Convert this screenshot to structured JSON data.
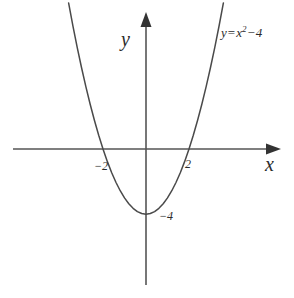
{
  "chart_data": {
    "type": "line",
    "title": "",
    "subtitle": "",
    "xlabel": "x",
    "ylabel": "y",
    "equation_label": "y = x² − 4",
    "equation_parts": {
      "lhs": "y",
      "equals": "=",
      "base": "x",
      "exponent": "2",
      "minus": "−",
      "constant": "4"
    },
    "function": "y = x^2 - 4",
    "grid": false,
    "legend": "none",
    "xlim": [
      -6.2,
      6.3
    ],
    "ylim": [
      -8.4,
      8.4
    ],
    "axis_arrows": [
      "x-positive",
      "y-positive"
    ],
    "x_tick_labels": [
      "−2",
      "2"
    ],
    "x_tick_values": [
      -2,
      2
    ],
    "y_tick_labels": [
      "−4"
    ],
    "y_tick_values": [
      -4
    ],
    "roots": [
      -2,
      2
    ],
    "vertex": [
      0,
      -4
    ],
    "y_intercept": -4,
    "x": [
      -3.6,
      -3.4,
      -3.2,
      -3.0,
      -2.8,
      -2.6,
      -2.4,
      -2.2,
      -2.0,
      -1.8,
      -1.6,
      -1.4,
      -1.2,
      -1.0,
      -0.8,
      -0.6,
      -0.4,
      -0.2,
      0.0,
      0.2,
      0.4,
      0.6,
      0.8,
      1.0,
      1.2,
      1.4,
      1.6,
      1.8,
      2.0,
      2.2,
      2.4,
      2.6,
      2.8,
      3.0,
      3.2,
      3.4,
      3.6
    ],
    "y": [
      8.96,
      7.56,
      6.24,
      5.0,
      3.84,
      2.76,
      1.76,
      0.84,
      0.0,
      -0.76,
      -1.44,
      -2.04,
      -2.56,
      -3.0,
      -3.36,
      -3.64,
      -3.84,
      -3.96,
      -4.0,
      -3.96,
      -3.84,
      -3.64,
      -3.36,
      -3.0,
      -2.56,
      -2.04,
      -1.44,
      -0.76,
      0.0,
      0.84,
      1.76,
      2.76,
      3.84,
      5.0,
      6.24,
      7.56,
      8.96
    ],
    "colors": {
      "curve": "#4a4a4a",
      "axis": "#555555",
      "text": "#2b2b2b",
      "background": "#ffffff"
    }
  }
}
